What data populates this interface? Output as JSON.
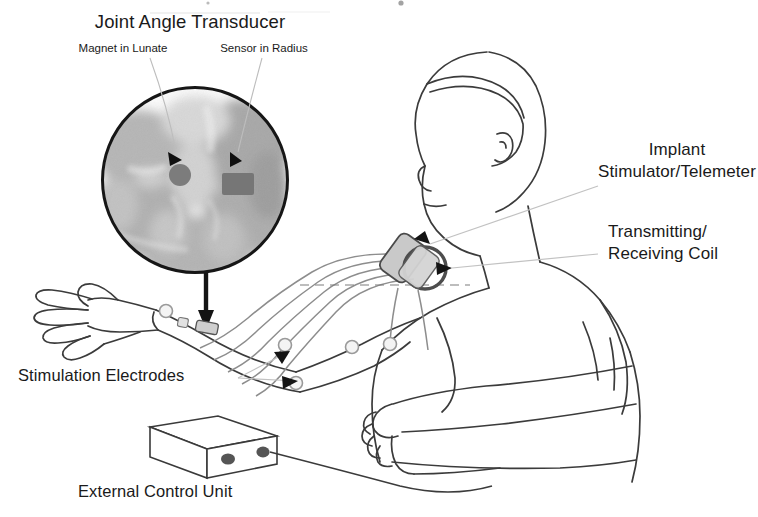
{
  "figure": {
    "kind": "anatomical-schematic",
    "background_color": "#ffffff",
    "ink_color": "#1a1a1a"
  },
  "labels": {
    "title": "Joint Angle Transducer",
    "magnet": "Magnet in Lunate",
    "sensor": "Sensor in Radius",
    "implant_line1": "Implant",
    "implant_line2": "Stimulator/Telemeter",
    "coil_line1": "Transmitting/",
    "coil_line2": "Receiving Coil",
    "electrodes": "Stimulation Electrodes",
    "control_unit": "External Control Unit"
  },
  "components": {
    "xray_inset": {
      "name": "radiograph-circle-inset",
      "shape": "circle",
      "center": [
        195,
        180
      ],
      "radius": 93,
      "border_color": "#1a1a1a",
      "magnet": {
        "shape": "circle",
        "fill": "#7c7c7c"
      },
      "sensor": {
        "shape": "rectangle",
        "fill": "#767676"
      }
    },
    "implant_device": {
      "name": "implant-stimulator-telemeter",
      "shape": "rounded-rectangle",
      "fill": "#c9c9c9",
      "stroke": "#4a4a4a"
    },
    "coil": {
      "name": "transmitting-receiving-coil",
      "shape": "ring",
      "stroke": "#4d4d4d",
      "diameter_px": 44
    },
    "electrodes": {
      "name": "stimulation-electrode",
      "count": 5,
      "shape": "small-circle",
      "stroke": "#9a9a9a"
    },
    "wires": {
      "name": "lead-wire",
      "count": 5,
      "stroke": "#8a8a8a"
    },
    "control_unit": {
      "name": "external-control-unit",
      "shape": "isometric-box",
      "fill": "#ffffff",
      "stroke": "#3a3a3a",
      "knobs": 2,
      "knob_fill": "#555555"
    },
    "wrist_sensor": {
      "name": "wrist-sensor-module",
      "fill": "#cfcfcf",
      "stroke": "#555555"
    }
  },
  "leader_lines": {
    "color_light": "#b9b9b9",
    "color_dark": "#1a1a1a"
  }
}
